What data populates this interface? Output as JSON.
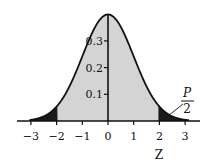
{
  "chart_data": {
    "type": "area",
    "title": "",
    "xlabel": "Z",
    "ylabel": "",
    "xlim": [
      -3.3,
      3.6
    ],
    "ylim": [
      0,
      0.4
    ],
    "x_ticks": [
      "-3",
      "-2",
      "-1",
      "0",
      "1",
      "2",
      "3"
    ],
    "x_tick_values": [
      -3,
      -2,
      -1,
      0,
      1,
      2,
      3
    ],
    "y_ticks": [
      "0.1",
      "0.2",
      "0.3"
    ],
    "y_tick_values": [
      0.1,
      0.2,
      0.3
    ],
    "grid": false,
    "legend": null,
    "series": [
      {
        "name": "Standard normal density",
        "function": "exp(-z^2/2)/sqrt(2*pi)",
        "x": [
          -3,
          -2.5,
          -2,
          -1.5,
          -1,
          -0.5,
          0,
          0.5,
          1,
          1.5,
          2,
          2.5,
          3
        ],
        "values": [
          0.004,
          0.018,
          0.054,
          0.13,
          0.242,
          0.352,
          0.399,
          0.352,
          0.242,
          0.13,
          0.054,
          0.018,
          0.004
        ]
      }
    ],
    "regions": [
      {
        "name": "left tail",
        "from": -3,
        "to": -1.96,
        "fill": "#1a1a1a"
      },
      {
        "name": "center",
        "from": -1.96,
        "to": 1.96,
        "fill": "#d4d4d4"
      },
      {
        "name": "right tail",
        "from": 1.96,
        "to": 3,
        "fill": "#1a1a1a"
      }
    ],
    "annotations": [
      {
        "text_numerator": "P",
        "text_denominator": "2",
        "points_to": "right tail"
      }
    ]
  },
  "labels": {
    "x_axis_label": "Z",
    "annotation_numerator": "P",
    "annotation_denominator": "2",
    "x_ticks": [
      "−3",
      "−2",
      "−1",
      "0",
      "1",
      "2",
      "3"
    ],
    "y_ticks": [
      "0.1",
      "0.2",
      "0.3"
    ]
  },
  "colors": {
    "center_fill": "#d4d4d4",
    "tail_fill": "#1a1a1a",
    "line": "#111111"
  }
}
